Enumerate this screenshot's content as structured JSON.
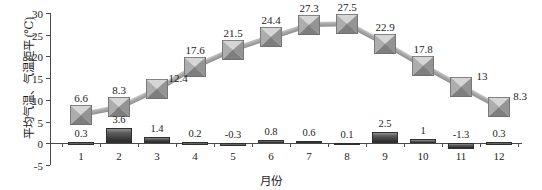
{
  "chart_data": {
    "type": "line",
    "title": "",
    "xlabel": "月份",
    "ylabel": "平均气温、气温距平 (℃)",
    "categories": [
      "1",
      "2",
      "3",
      "4",
      "5",
      "6",
      "7",
      "8",
      "9",
      "10",
      "11",
      "12"
    ],
    "ylim": [
      -5,
      30
    ],
    "yticks": [
      "30",
      "25",
      "20",
      "15",
      "10",
      "5",
      "0",
      "-5"
    ],
    "ytick_values": [
      30,
      25,
      20,
      15,
      10,
      5,
      0,
      -5
    ],
    "grid": false,
    "legend": "none",
    "series": [
      {
        "name": "平均气温",
        "type": "line",
        "marker": "square-pyramid",
        "values": [
          6.6,
          8.3,
          12.4,
          17.6,
          21.5,
          24.4,
          27.3,
          27.5,
          22.9,
          17.8,
          13,
          8.3
        ],
        "labels": [
          "6.6",
          "8.3",
          "12.4",
          "17.6",
          "21.5",
          "24.4",
          "27.3",
          "27.5",
          "22.9",
          "17.8",
          "13",
          "8.3"
        ],
        "color": "#a0a0a0"
      },
      {
        "name": "气温距平",
        "type": "bar",
        "values": [
          0.3,
          3.6,
          1.4,
          0.2,
          -0.3,
          0.8,
          0.6,
          0.1,
          2.5,
          1,
          -1.3,
          0.3
        ],
        "labels": [
          "0.3",
          "3.6",
          "1.4",
          "0.2",
          "-0.3",
          "0.8",
          "0.6",
          "0.1",
          "2.5",
          "1",
          "-1.3",
          "0.3"
        ],
        "color": "#3c3c3c"
      }
    ]
  },
  "axis": {
    "line_color": "#4a4a4a"
  }
}
